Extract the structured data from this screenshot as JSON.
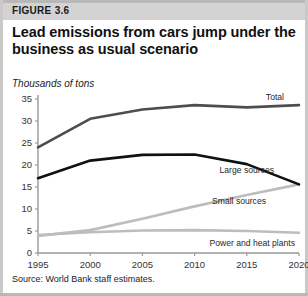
{
  "figure": {
    "tag": "FIGURE 3.6",
    "title": "Lead emissions from cars jump under the business as usual scenario",
    "subtitle": "Thousands of tons",
    "source": "Source: World Bank staff estimates."
  },
  "chart_data": {
    "type": "line",
    "title": "Lead emissions from cars jump under the business as usual scenario",
    "subtitle": "Thousands of tons",
    "xlabel": "",
    "ylabel": "Thousands of tons",
    "x": [
      1995,
      2000,
      2005,
      2010,
      2015,
      2020
    ],
    "xticklabels": [
      "1995",
      "2000",
      "2005",
      "2010",
      "2015",
      "2020"
    ],
    "xlim": [
      1995,
      2020
    ],
    "ylim": [
      0,
      35
    ],
    "yticks": [
      0,
      5,
      10,
      15,
      20,
      25,
      30,
      35
    ],
    "yticklabels": [
      "0",
      "5",
      "10",
      "15",
      "20",
      "25",
      "30",
      "35"
    ],
    "grid": false,
    "legend": "inline-right",
    "series": [
      {
        "name": "Total",
        "color": "#4d4d4d",
        "width": 2.6,
        "label_x": 2020,
        "values": [
          24.0,
          30.5,
          32.6,
          33.6,
          33.1,
          33.6
        ]
      },
      {
        "name": "Large sources",
        "color": "#111111",
        "width": 2.6,
        "label_x": 2017,
        "values": [
          17.0,
          21.0,
          22.3,
          22.4,
          20.2,
          15.6
        ]
      },
      {
        "name": "Small sources",
        "color": "#bdbdbd",
        "width": 2.6,
        "label_x": 2015,
        "values": [
          3.9,
          5.2,
          7.8,
          10.6,
          13.2,
          15.6
        ]
      },
      {
        "name": "Power and heat plants",
        "color": "#bdbdbd",
        "width": 2.6,
        "label_x": 2014,
        "values": [
          4.1,
          4.7,
          5.1,
          5.2,
          5.0,
          4.6
        ]
      }
    ]
  },
  "axis": {
    "y_labels": [
      "35",
      "30",
      "25",
      "20",
      "15",
      "10",
      "5",
      "0"
    ],
    "x_labels": [
      "1995",
      "2000",
      "2005",
      "2010",
      "2015",
      "2020"
    ]
  },
  "series_labels": {
    "total": "Total",
    "large_sources": "Large sources",
    "small_sources": "Small sources",
    "power_heat": "Power and heat plants"
  },
  "colors": {
    "total": "#4d4d4d",
    "large_sources": "#111111",
    "small_sources": "#bdbdbd",
    "power_heat": "#bdbdbd",
    "band": "#d3d3d3",
    "axis": "#999999"
  }
}
